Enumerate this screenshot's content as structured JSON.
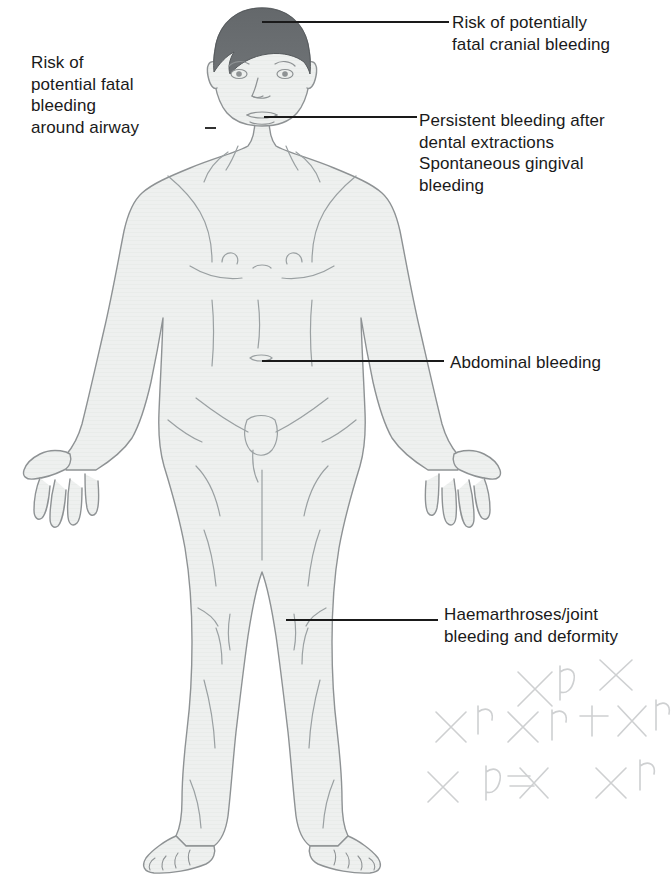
{
  "figure": {
    "background_color": "#ffffff",
    "body_fill_color": "#eef0ef",
    "body_outline_color": "#8e9294",
    "hair_color": "#5f6366",
    "text_color": "#1a1a1a",
    "leader_line_color": "#1a1a1a",
    "scribble_color": "#c9cbcd"
  },
  "callouts": [
    {
      "id": "airway",
      "text": "Risk of\npotential fatal\nbleeding\naround airway",
      "side": "left",
      "anchor": "neck / airway",
      "leader": {
        "x1": 216,
        "y1": 128,
        "x2": 205,
        "y2": 128
      }
    },
    {
      "id": "cranial",
      "text": "Risk of potentially\nfatal cranial bleeding",
      "side": "right",
      "anchor": "cranium / scalp",
      "leader": {
        "x1": 262,
        "y1": 22,
        "x2": 449,
        "y2": 22
      }
    },
    {
      "id": "dental",
      "text": "Persistent bleeding after\ndental extractions\nSpontaneous gingival\nbleeding",
      "side": "right",
      "anchor": "mouth / gums",
      "leader": {
        "x1": 264,
        "y1": 117,
        "x2": 417,
        "y2": 117
      }
    },
    {
      "id": "abdominal",
      "text": "Abdominal bleeding",
      "side": "right",
      "anchor": "abdomen / navel",
      "leader": {
        "x1": 262,
        "y1": 361,
        "x2": 444,
        "y2": 361
      }
    },
    {
      "id": "joint",
      "text": "Haemarthroses/joint\nbleeding and deformity",
      "side": "right",
      "anchor": "knee joint",
      "leader": {
        "x1": 286,
        "y1": 620,
        "x2": 438,
        "y2": 620
      }
    }
  ],
  "annotations": {
    "scribbles_note": "faint pencil X and h marks in lower right corner"
  }
}
